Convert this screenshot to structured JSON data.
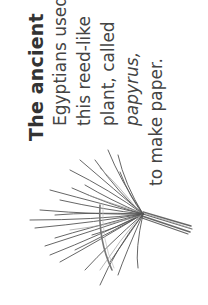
{
  "caption": {
    "title": "The ancient",
    "lines": [
      "Egyptians used",
      "this reed-like",
      "plant, called",
      "papyrus,",
      "to make paper."
    ]
  },
  "illustration": {
    "subject": "papyrus-plant",
    "stroke_color": "#555555",
    "highlight_color": "#9a9a9a"
  }
}
